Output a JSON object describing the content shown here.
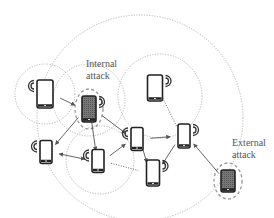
{
  "diagram": {
    "title": "",
    "labels": {
      "internal": {
        "line1": "Internal",
        "line2": "attack"
      },
      "external": {
        "line1": "External",
        "line2": "attack"
      }
    },
    "colors": {
      "phone_outline": "#222222",
      "malicious_fill": "#6a6a6a",
      "range_circle": "#b8b8b8",
      "attack_oval": "#9a9a9a",
      "arrow": "#555555",
      "text": "#555555"
    },
    "nodes": [
      {
        "id": "A",
        "role": "normal",
        "x": 45,
        "y": 94,
        "w": 16,
        "h": 28,
        "waves": "left"
      },
      {
        "id": "B",
        "role": "internal-attacker",
        "x": 89,
        "y": 109,
        "w": 14,
        "h": 26,
        "waves": "right"
      },
      {
        "id": "C",
        "role": "normal",
        "x": 155,
        "y": 88,
        "w": 15,
        "h": 26,
        "waves": "right"
      },
      {
        "id": "D",
        "role": "normal",
        "x": 46,
        "y": 152,
        "w": 12,
        "h": 23,
        "waves": "left"
      },
      {
        "id": "E",
        "role": "normal",
        "x": 98,
        "y": 161,
        "w": 12,
        "h": 23,
        "waves": "left"
      },
      {
        "id": "F",
        "role": "normal",
        "x": 137,
        "y": 139,
        "w": 12,
        "h": 23,
        "waves": "left"
      },
      {
        "id": "G",
        "role": "normal",
        "x": 184,
        "y": 136,
        "w": 12,
        "h": 24,
        "waves": "right"
      },
      {
        "id": "H",
        "role": "normal",
        "x": 153,
        "y": 173,
        "w": 13,
        "h": 26,
        "waves": "right"
      },
      {
        "id": "I",
        "role": "external-attacker",
        "x": 228,
        "y": 181,
        "w": 14,
        "h": 22,
        "waves": "none"
      }
    ],
    "links": [
      {
        "from": "A",
        "to": "B",
        "dir": "to"
      },
      {
        "from": "B",
        "to": "F",
        "dir": "to"
      },
      {
        "from": "B",
        "to": "D",
        "dir": "to"
      },
      {
        "from": "B",
        "to": "E",
        "dir": "to"
      },
      {
        "from": "D",
        "to": "E",
        "dir": "both"
      },
      {
        "from": "E",
        "to": "F",
        "dir": "to"
      },
      {
        "from": "F",
        "to": "G",
        "dir": "to"
      },
      {
        "from": "F",
        "to": "H",
        "dir": "to"
      },
      {
        "from": "H",
        "to": "G",
        "dir": "from"
      },
      {
        "from": "C",
        "to": "G",
        "dir": "none"
      },
      {
        "from": "I",
        "to": "G",
        "dir": "to"
      },
      {
        "from": "E",
        "to": "H",
        "dir": "none"
      }
    ],
    "ranges": [
      {
        "name": "network-outer",
        "cx": 140,
        "cy": 118,
        "r": 103
      },
      {
        "name": "range-A",
        "cx": 45,
        "cy": 94,
        "r": 30
      },
      {
        "name": "range-B",
        "cx": 89,
        "cy": 100,
        "r": 36
      },
      {
        "name": "range-C",
        "cx": 160,
        "cy": 96,
        "r": 42
      },
      {
        "name": "range-E",
        "cx": 100,
        "cy": 160,
        "r": 34
      }
    ]
  }
}
